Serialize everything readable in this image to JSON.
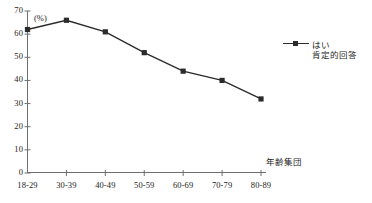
{
  "chart_data": {
    "type": "line",
    "title": "",
    "subtitle": "",
    "xlabel": "年齢集団",
    "ylabel": "(%)",
    "categories": [
      "18-29",
      "30-39",
      "40-49",
      "50-59",
      "60-69",
      "70-79",
      "80-89"
    ],
    "series": [
      {
        "name": "はい",
        "sublabel": "肯定的回答",
        "values": [
          62,
          66,
          61,
          52,
          44,
          40,
          32
        ],
        "color": "#2b2b2b",
        "marker": "square"
      }
    ],
    "ylim": [
      0,
      70
    ],
    "yticks": [
      0,
      10,
      20,
      30,
      40,
      50,
      60,
      70
    ],
    "ytick_labels": [
      "0",
      "10",
      "20",
      "30",
      "40",
      "50",
      "60",
      "70"
    ],
    "grid": false,
    "legend_position": "right"
  },
  "axes": {
    "y_unit_label": "(%)",
    "x_axis_title": "年齢集団"
  },
  "legend": {
    "entries": [
      {
        "label": "はい",
        "sublabel": "肯定的回答"
      }
    ]
  },
  "colors": {
    "line": "#2b2b2b",
    "marker": "#2b2b2b",
    "axis": "#6f6f6f",
    "text": "#1c1c1c",
    "background": "#ffffff"
  }
}
